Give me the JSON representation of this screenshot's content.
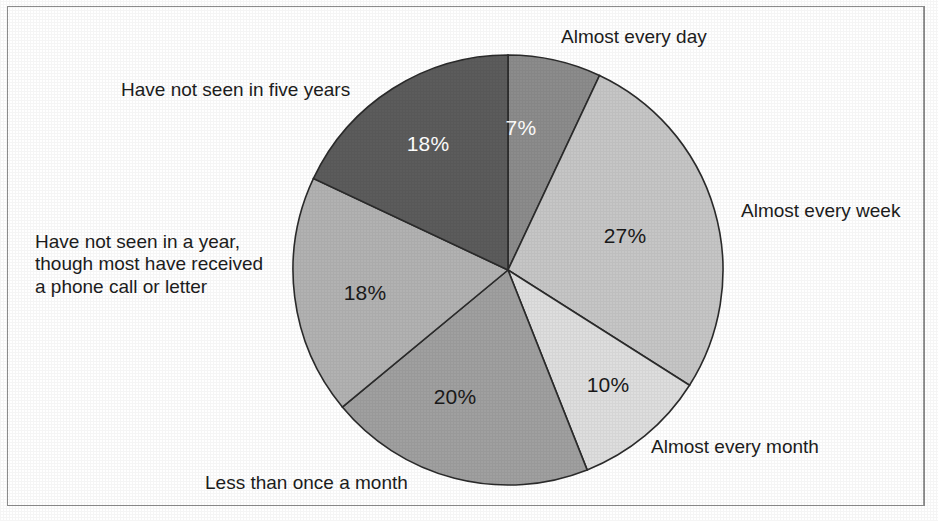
{
  "frame": {
    "border_color": "#8d8d8d"
  },
  "chart_data": {
    "type": "pie",
    "title": "",
    "subtitle": "",
    "xlabel": "",
    "ylabel": "",
    "grid": false,
    "legend_position": "around-slices",
    "total": 100,
    "units": "percent",
    "start_angle_deg": 0,
    "direction": "clockwise",
    "center": {
      "x": 508,
      "y": 270
    },
    "radius": 215,
    "slices": [
      {
        "label": "Almost every day",
        "value": 7,
        "value_text": "7%",
        "color": "#8c8c8c",
        "text_color": "#ffffff",
        "label_position": "top-right"
      },
      {
        "label": "Almost every week",
        "value": 27,
        "value_text": "27%",
        "color": "#c6c6c6",
        "text_color": "#1a1a1a",
        "label_position": "right"
      },
      {
        "label": "Almost every month",
        "value": 10,
        "value_text": "10%",
        "color": "#dedede",
        "text_color": "#1a1a1a",
        "label_position": "bottom-right"
      },
      {
        "label": "Less than once a month",
        "value": 20,
        "value_text": "20%",
        "color": "#a0a0a0",
        "text_color": "#1a1a1a",
        "label_position": "bottom"
      },
      {
        "label": "Have not seen in a year,\nthough most have received\na phone call or letter",
        "value": 18,
        "value_text": "18%",
        "color": "#b2b2b2",
        "text_color": "#1a1a1a",
        "label_position": "left"
      },
      {
        "label": "Have not seen in five years",
        "value": 18,
        "value_text": "18%",
        "color": "#5c5c5c",
        "text_color": "#ffffff",
        "label_position": "top-left"
      }
    ]
  },
  "labels": {
    "almost_every_day": "Almost every day",
    "almost_every_week": "Almost every week",
    "almost_every_month": "Almost every month",
    "less_than_once_a_month": "Less than once a month",
    "have_not_seen_in_a_year": "Have not seen in a year,\nthough most have received\na phone call or letter",
    "have_not_seen_in_five_years": "Have not seen in five years"
  },
  "values": {
    "almost_every_day": "7%",
    "almost_every_week": "27%",
    "almost_every_month": "10%",
    "less_than_once_a_month": "20%",
    "have_not_seen_in_a_year": "18%",
    "have_not_seen_in_five_years": "18%"
  }
}
